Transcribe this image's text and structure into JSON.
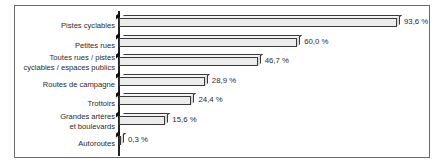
{
  "chart_data": {
    "type": "bar",
    "orientation": "horizontal",
    "style": "3d",
    "title": "",
    "xlabel": "",
    "ylabel": "",
    "categories": [
      "Pistes cyclables",
      "Petites rues",
      "Toutes rues / pistes cyclables / espaces publics",
      "Routes de campagne",
      "Trottoirs",
      "Grandes artères et boulevards",
      "Autoroutes"
    ],
    "values": [
      93.6,
      60.0,
      46.7,
      28.9,
      24.4,
      15.6,
      0.3
    ],
    "value_labels": [
      "93,6 %",
      "60,0 %",
      "46,7 %",
      "28,9 %",
      "24,4 %",
      "15,6 %",
      "0,3 %"
    ],
    "unit": "%",
    "xlim": [
      0,
      100
    ],
    "grid": false,
    "legend": null
  },
  "rows": [
    {
      "label_lines": [
        "Pistes cyclables"
      ],
      "value": 93.6,
      "value_label": "93,6 %"
    },
    {
      "label_lines": [
        "Petites rues"
      ],
      "value": 60.0,
      "value_label": "60,0 %"
    },
    {
      "label_lines": [
        "Toutes rues / pistes",
        "cyclables / espaces publics"
      ],
      "value": 46.7,
      "value_label": "46,7 %"
    },
    {
      "label_lines": [
        "Routes de campagne"
      ],
      "value": 28.9,
      "value_label": "28,9 %"
    },
    {
      "label_lines": [
        "Trottoirs"
      ],
      "value": 24.4,
      "value_label": "24,4 %"
    },
    {
      "label_lines": [
        "Grandes artères",
        "et boulevards"
      ],
      "value": 15.6,
      "value_label": "15,6 %"
    },
    {
      "label_lines": [
        "Autoroutes"
      ],
      "value": 0.3,
      "value_label": "0,3 %"
    }
  ]
}
